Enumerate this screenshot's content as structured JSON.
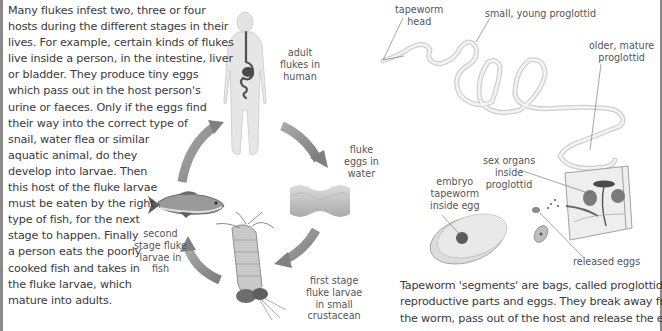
{
  "page": {
    "type": "textbook illustration page",
    "section": "flukes and tapeworms"
  },
  "fluke_text": {
    "lines": [
      "Many flukes infest two, three or four",
      "hosts during the different stages in their",
      "lives. For example, certain kinds of flukes",
      "live inside a person, in the intestine, liver",
      "or bladder. They produce tiny eggs",
      "which pass out in the host person's",
      "urine or faeces. Only if the eggs find",
      "their way into the correct type of",
      "snail, water flea or similar",
      "aquatic animal, do they",
      "develop into larvae. Then",
      "this host of the fluke larvae",
      "must be eaten by the right",
      "type of fish, for the next",
      "stage to happen. Finally",
      "a person eats the poorly",
      "cooked fish and takes in",
      "the fluke larvae, which",
      "mature into adults."
    ]
  },
  "fluke_cycle": {
    "stages": [
      {
        "id": "human",
        "icon": "human-body-icon",
        "label_lines": [
          "adult",
          "flukes in",
          "human"
        ]
      },
      {
        "id": "water",
        "icon": "water-waves-icon",
        "label_lines": [
          "fluke",
          "eggs in",
          "water"
        ]
      },
      {
        "id": "crustacean",
        "icon": "crustacean-icon",
        "label_lines": [
          "first stage",
          "fluke larvae",
          "in small",
          "crustacean"
        ]
      },
      {
        "id": "fish",
        "icon": "fish-icon",
        "label_lines": [
          "second",
          "stage fluke",
          "larvae in",
          "fish"
        ]
      }
    ],
    "arrow_color": "#8c8c8c"
  },
  "tapeworm": {
    "labels": {
      "head": [
        "tapeworm",
        "head"
      ],
      "young": [
        "small, young proglottid"
      ],
      "mature": [
        "older, mature",
        "proglottid"
      ],
      "sex_organs": [
        "sex organs",
        "inside",
        "proglottid"
      ],
      "embryo": [
        "embryo",
        "tapeworm",
        "inside egg"
      ],
      "released": [
        "released eggs"
      ]
    },
    "caption_lines": [
      "Tapeworm 'segments' are bags, called proglottids, of",
      "reproductive parts and eggs. They break away from",
      "the worm, pass out of the host and release the eggs."
    ]
  }
}
